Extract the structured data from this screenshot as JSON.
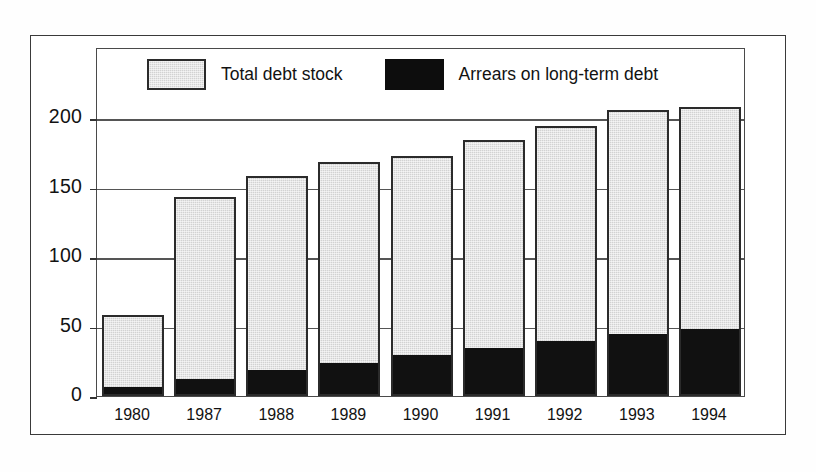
{
  "chart_data": {
    "type": "bar",
    "title": "",
    "subtitle": "",
    "xlabel": "",
    "ylabel": "",
    "stacked": true,
    "grid": true,
    "legend_position": "top-inside",
    "categories": [
      "1980",
      "1987",
      "1988",
      "1989",
      "1990",
      "1991",
      "1992",
      "1993",
      "1994"
    ],
    "ylim": [
      0,
      200
    ],
    "yticks": [
      0,
      50,
      100,
      150,
      200
    ],
    "ytick_labels": [
      "0",
      "50",
      "100",
      "150",
      "200"
    ],
    "series": [
      {
        "name": "Total debt stock",
        "color": "#d2d2d2",
        "values": [
          58,
          143,
          158,
          168,
          173,
          184,
          194,
          206,
          208
        ]
      },
      {
        "name": "Arrears on long-term debt",
        "color": "#111111",
        "values": [
          5,
          11,
          17,
          22,
          28,
          33,
          38,
          43,
          47
        ]
      }
    ]
  },
  "legend": {
    "entries": [
      {
        "label": "Total debt stock",
        "swatch": "gray"
      },
      {
        "label": "Arrears on long-term debt",
        "swatch": "black"
      }
    ]
  }
}
